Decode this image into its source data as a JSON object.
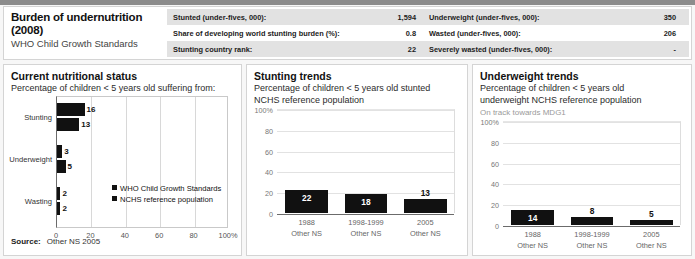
{
  "header": {
    "title": "Burden of undernutrition (2008)",
    "subtitle": "WHO Child Growth Standards",
    "rows": [
      {
        "label": "Stunted (under-fives, 000):",
        "value": "1,594",
        "label2": "Underweight (under-fives, 000):",
        "value2": "350"
      },
      {
        "label": "Share of developing world stunting burden (%):",
        "value": "0.8",
        "label2": "Wasted (under-fives, 000):",
        "value2": "206"
      },
      {
        "label": "Stunting country rank:",
        "value": "22",
        "label2": "Severely wasted (under-fives, 000):",
        "value2": "-"
      }
    ]
  },
  "panel1": {
    "title": "Current nutritional status",
    "subtitle": "Percentage of children < 5 years old suffering from:",
    "legend": [
      "WHO Child Growth Standards",
      "NCHS reference population"
    ],
    "source_label": "Source:",
    "source_value": "Other NS 2005"
  },
  "panel2": {
    "title": "Stunting trends",
    "subtitle_line1": "Percentage of children < 5 years old stunted",
    "subtitle_line2": "NCHS reference population"
  },
  "panel3": {
    "title": "Underweight trends",
    "subtitle_line1": "Percentage of children < 5 years old",
    "subtitle_line2": "underweight NCHS reference population",
    "note": "On track towards MDG1"
  },
  "chart_data": [
    {
      "type": "bar",
      "id": "current-nutritional-status",
      "orientation": "horizontal",
      "title": "Current nutritional status",
      "subtitle": "Percentage of children < 5 years old suffering from:",
      "categories": [
        "Stunting",
        "Underweight",
        "Wasting"
      ],
      "series": [
        {
          "name": "WHO Child Growth Standards",
          "values": [
            16,
            3,
            2
          ],
          "color": "#111111"
        },
        {
          "name": "NCHS reference population",
          "values": [
            13,
            5,
            2
          ],
          "color": "#111111"
        }
      ],
      "xlabel": "",
      "ylabel": "",
      "xlim": [
        0,
        100
      ],
      "xticks": [
        "0",
        "20",
        "40",
        "60",
        "80",
        "100%"
      ],
      "grid": true,
      "legend_position": "inside-right"
    },
    {
      "type": "bar",
      "id": "stunting-trends",
      "orientation": "vertical",
      "title": "Stunting trends",
      "subtitle": "Percentage of children < 5 years old stunted NCHS reference population",
      "categories": [
        "1988",
        "1998-1999",
        "2005"
      ],
      "category_sources": [
        "Other NS",
        "Other NS",
        "Other NS"
      ],
      "values": [
        22,
        18,
        13
      ],
      "ylim": [
        0,
        100
      ],
      "yticks": [
        "0",
        "20",
        "40",
        "60",
        "80",
        "100%"
      ],
      "grid": true,
      "bar_color": "#111111"
    },
    {
      "type": "bar",
      "id": "underweight-trends",
      "orientation": "vertical",
      "title": "Underweight trends",
      "subtitle": "Percentage of children < 5 years old underweight NCHS reference population",
      "annotation": "On track towards MDG1",
      "categories": [
        "1988",
        "1998-1999",
        "2005"
      ],
      "category_sources": [
        "Other NS",
        "Other NS",
        "Other NS"
      ],
      "values": [
        14,
        8,
        5
      ],
      "ylim": [
        0,
        100
      ],
      "yticks": [
        "0",
        "20",
        "40",
        "60",
        "80",
        "100%"
      ],
      "grid": true,
      "bar_color": "#111111"
    }
  ]
}
